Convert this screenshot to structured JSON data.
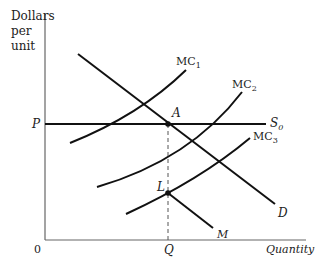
{
  "diagram": {
    "y_axis_label_lines": [
      "Dollars",
      "per",
      "unit"
    ],
    "x_axis_label": "Quantity",
    "origin_label": "0",
    "price_label": "P",
    "quantity_label": "Q",
    "curves": {
      "mc1": {
        "label": "MC",
        "sub": "1"
      },
      "mc2": {
        "label": "MC",
        "sub": "2"
      },
      "mc3": {
        "label": "MC",
        "sub": "3"
      },
      "supply": {
        "label": "S",
        "sub": "0"
      },
      "demand": {
        "label": "D"
      },
      "m": {
        "label": "M"
      }
    },
    "points": {
      "a": {
        "label": "A"
      },
      "l": {
        "label": "L"
      }
    },
    "colors": {
      "ink": "#111111",
      "axis": "#555555"
    }
  }
}
